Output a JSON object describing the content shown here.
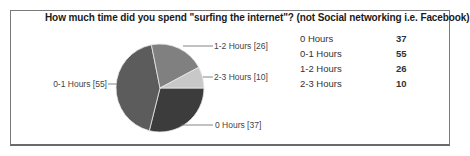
{
  "chart_data": {
    "type": "pie",
    "title": "How much time did you spend \"surfing the internet\"? (not Social networking i.e. Facebook)",
    "categories": [
      "0 Hours",
      "0-1 Hours",
      "1-2 Hours",
      "2-3 Hours"
    ],
    "values": [
      37,
      55,
      26,
      10
    ],
    "colors": [
      "#3c3c3c",
      "#5c5c5c",
      "#808080",
      "#c8c8c8"
    ],
    "slice_labels": [
      "0 Hours [37]",
      "0-1 Hours [55]",
      "1-2 Hours [26]",
      "2-3 Hours [10]"
    ],
    "legend_position": "right (table)"
  },
  "table": {
    "rows": [
      {
        "label": "0 Hours",
        "value": "37"
      },
      {
        "label": "0-1 Hours",
        "value": "55"
      },
      {
        "label": "1-2 Hours",
        "value": "26"
      },
      {
        "label": "2-3 Hours",
        "value": "10"
      }
    ]
  }
}
